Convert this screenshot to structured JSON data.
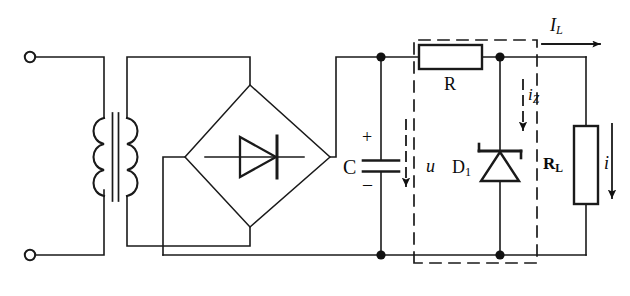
{
  "figure": {
    "type": "circuit-schematic",
    "width": 630,
    "height": 296,
    "line_color": "#1a1a1a",
    "background": "#ffffff"
  },
  "labels": {
    "capacitor": "C",
    "capacitor_plus": "+",
    "capacitor_minus": "–",
    "resistor_series": "R",
    "diode_zener": "D",
    "diode_zener_sub": "1",
    "load_resistor": "R",
    "load_resistor_sub": "L",
    "voltage_u": "u",
    "current_iz": "i",
    "current_iz_sub": "Z",
    "current_il": "I",
    "current_il_sub": "L",
    "current_i": "i"
  },
  "components": [
    {
      "name": "input-terminal-top",
      "type": "terminal",
      "label": ""
    },
    {
      "name": "input-terminal-bottom",
      "type": "terminal",
      "label": ""
    },
    {
      "name": "transformer",
      "type": "transformer",
      "label": ""
    },
    {
      "name": "bridge-rectifier",
      "type": "diode-bridge",
      "label": ""
    },
    {
      "name": "filter-capacitor",
      "type": "capacitor",
      "label": "C"
    },
    {
      "name": "series-resistor",
      "type": "resistor",
      "label": "R"
    },
    {
      "name": "zener-diode",
      "type": "zener-diode",
      "label": "D1"
    },
    {
      "name": "load-resistor",
      "type": "resistor",
      "label": "RL"
    }
  ],
  "annotations": [
    {
      "name": "regulator-dashed-boundary",
      "type": "dashed-box"
    },
    {
      "name": "u-voltage-arrow",
      "type": "arrow",
      "direction": "down"
    },
    {
      "name": "iz-current-arrow",
      "type": "arrow",
      "direction": "down"
    },
    {
      "name": "il-current-arrow",
      "type": "arrow",
      "direction": "right"
    },
    {
      "name": "i-current-arrow",
      "type": "arrow",
      "direction": "down"
    }
  ]
}
